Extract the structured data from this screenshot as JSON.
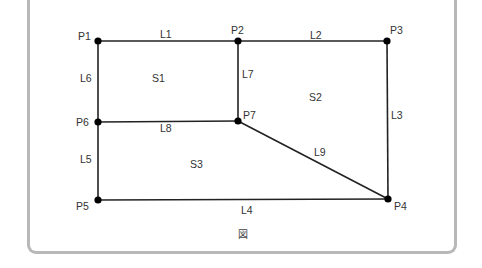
{
  "figure": {
    "caption": "図",
    "frame_color": "#b8b8b8",
    "line_color": "#222222",
    "point_color": "#000000"
  },
  "points": [
    {
      "id": "P1",
      "label": "P1",
      "x": 98,
      "y": 41,
      "lx": 78,
      "ly": 40
    },
    {
      "id": "P2",
      "label": "P2",
      "x": 238,
      "y": 41,
      "lx": 231,
      "ly": 34
    },
    {
      "id": "P3",
      "label": "P3",
      "x": 387,
      "y": 41,
      "lx": 390,
      "ly": 34
    },
    {
      "id": "P4",
      "label": "P4",
      "x": 388,
      "y": 199,
      "lx": 394,
      "ly": 210
    },
    {
      "id": "P5",
      "label": "P5",
      "x": 98,
      "y": 200,
      "lx": 76,
      "ly": 210
    },
    {
      "id": "P6",
      "label": "P6",
      "x": 98,
      "y": 122,
      "lx": 76,
      "ly": 126
    },
    {
      "id": "P7",
      "label": "P7",
      "x": 238,
      "y": 121,
      "lx": 243,
      "ly": 119
    }
  ],
  "lines": [
    {
      "id": "L1",
      "label": "L1",
      "from": "P1",
      "to": "P2",
      "lx": 160,
      "ly": 38
    },
    {
      "id": "L2",
      "label": "L2",
      "from": "P2",
      "to": "P3",
      "lx": 310,
      "ly": 39
    },
    {
      "id": "L3",
      "label": "L3",
      "from": "P3",
      "to": "P4",
      "lx": 391,
      "ly": 119
    },
    {
      "id": "L4",
      "label": "L4",
      "from": "P5",
      "to": "P4",
      "lx": 241,
      "ly": 214
    },
    {
      "id": "L5",
      "label": "L5",
      "from": "P6",
      "to": "P5",
      "lx": 80,
      "ly": 163
    },
    {
      "id": "L6",
      "label": "L6",
      "from": "P1",
      "to": "P6",
      "lx": 80,
      "ly": 82
    },
    {
      "id": "L7",
      "label": "L7",
      "from": "P2",
      "to": "P7",
      "lx": 242,
      "ly": 78
    },
    {
      "id": "L8",
      "label": "L8",
      "from": "P6",
      "to": "P7",
      "lx": 160,
      "ly": 132
    },
    {
      "id": "L9",
      "label": "L9",
      "from": "P7",
      "to": "P4",
      "lx": 314,
      "ly": 156
    }
  ],
  "surfaces": [
    {
      "id": "S1",
      "label": "S1",
      "lx": 152,
      "ly": 82
    },
    {
      "id": "S2",
      "label": "S2",
      "lx": 309,
      "ly": 101
    },
    {
      "id": "S3",
      "label": "S3",
      "lx": 190,
      "ly": 168
    }
  ]
}
